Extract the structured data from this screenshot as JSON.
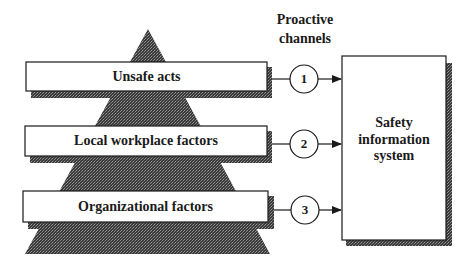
{
  "diagram": {
    "header": {
      "line1": "Proactive",
      "line2": "channels"
    },
    "levels": [
      {
        "label": "Unsafe acts",
        "channel": "1"
      },
      {
        "label": "Local workplace factors",
        "channel": "2"
      },
      {
        "label": "Organizational factors",
        "channel": "3"
      }
    ],
    "target": {
      "line1": "Safety",
      "line2": "information",
      "line3": "system"
    },
    "colors": {
      "ink": "#1a1a1a",
      "pyramid_fill": "#3c3c3c",
      "shadow": "#2a2a2a",
      "background": "#ffffff"
    }
  }
}
